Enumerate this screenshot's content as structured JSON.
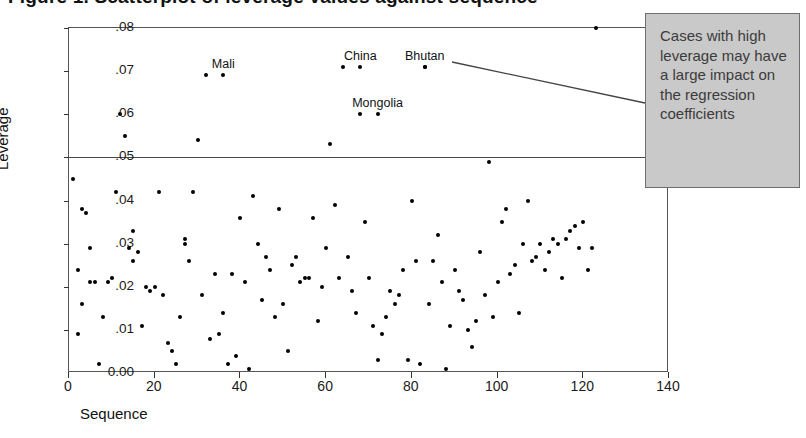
{
  "title": "Figure 1. Scatterplot of leverage values against sequence",
  "annotation": {
    "text": "Cases with high leverage may have a large impact on the regression coefficients",
    "box_color": "#c9c9c9",
    "border_color": "#6e6e6e"
  },
  "axes": {
    "ylabel": "Leverage",
    "xlabel": "Sequence",
    "yticks": [
      "0.00",
      ".01",
      ".02",
      ".03",
      ".04",
      ".05",
      ".06",
      ".07",
      ".08"
    ],
    "ytick_values": [
      0,
      0.01,
      0.02,
      0.03,
      0.04,
      0.05,
      0.06,
      0.07,
      0.08
    ],
    "xticks": [
      "0",
      "20",
      "40",
      "60",
      "80",
      "100",
      "120",
      "140"
    ],
    "xtick_values": [
      0,
      20,
      40,
      60,
      80,
      100,
      120,
      140
    ]
  },
  "chart_data": {
    "type": "scatter",
    "title": "Figure 1. Scatterplot of leverage values against sequence",
    "xlabel": "Sequence",
    "ylabel": "Leverage",
    "xlim": [
      0,
      140
    ],
    "ylim": [
      0,
      0.08
    ],
    "grid": false,
    "legend": "none",
    "reference_lines": [
      {
        "axis": "y",
        "value": 0.05,
        "label": "leverage cutoff"
      }
    ],
    "annotations": [
      {
        "text": "Mali",
        "x": 36,
        "y": 0.069
      },
      {
        "text": "China",
        "x": 68,
        "y": 0.071
      },
      {
        "text": "Bhutan",
        "x": 83,
        "y": 0.071
      },
      {
        "text": "Mongolia",
        "x": 72,
        "y": 0.06
      }
    ],
    "labeled_points": [
      {
        "name": "Mali",
        "x": 36,
        "y": 0.069
      },
      {
        "name": "China",
        "x": 68,
        "y": 0.071
      },
      {
        "name": "Bhutan",
        "x": 83,
        "y": 0.071
      },
      {
        "name": "Mongolia",
        "x": 72,
        "y": 0.06
      }
    ],
    "x": [
      1,
      2,
      2,
      3,
      3,
      4,
      5,
      5,
      6,
      7,
      8,
      9,
      10,
      11,
      12,
      13,
      14,
      15,
      15,
      16,
      17,
      18,
      19,
      20,
      21,
      22,
      23,
      24,
      25,
      26,
      27,
      27,
      28,
      29,
      30,
      31,
      32,
      33,
      34,
      35,
      36,
      37,
      38,
      39,
      40,
      41,
      42,
      43,
      44,
      45,
      46,
      47,
      48,
      49,
      50,
      51,
      52,
      53,
      54,
      55,
      56,
      57,
      58,
      59,
      60,
      61,
      62,
      63,
      64,
      65,
      66,
      67,
      68,
      69,
      70,
      71,
      72,
      73,
      74,
      75,
      76,
      77,
      78,
      79,
      80,
      81,
      82,
      83,
      84,
      85,
      86,
      87,
      88,
      89,
      90,
      91,
      92,
      93,
      94,
      95,
      96,
      97,
      98,
      99,
      100,
      101,
      102,
      103,
      104,
      105,
      106,
      107,
      108,
      109,
      110,
      111,
      112,
      113,
      114,
      115,
      116,
      117,
      118,
      119,
      120,
      121,
      122,
      123
    ],
    "y": [
      0.045,
      0.024,
      0.009,
      0.016,
      0.038,
      0.037,
      0.029,
      0.021,
      0.021,
      0.002,
      0.013,
      0.021,
      0.022,
      0.042,
      0.06,
      0.055,
      0.029,
      0.026,
      0.033,
      0.028,
      0.011,
      0.02,
      0.019,
      0.02,
      0.042,
      0.018,
      0.007,
      0.005,
      0.002,
      0.013,
      0.03,
      0.031,
      0.026,
      0.042,
      0.054,
      0.018,
      0.069,
      0.008,
      0.023,
      0.009,
      0.014,
      0.002,
      0.023,
      0.004,
      0.036,
      0.021,
      0.001,
      0.041,
      0.03,
      0.017,
      0.027,
      0.024,
      0.013,
      0.038,
      0.016,
      0.005,
      0.025,
      0.027,
      0.021,
      0.022,
      0.022,
      0.036,
      0.012,
      0.02,
      0.029,
      0.053,
      0.039,
      0.022,
      0.071,
      0.027,
      0.019,
      0.014,
      0.06,
      0.035,
      0.022,
      0.011,
      0.003,
      0.009,
      0.013,
      0.019,
      0.016,
      0.018,
      0.024,
      0.003,
      0.04,
      0.026,
      0.002,
      0.071,
      0.016,
      0.026,
      0.032,
      0.021,
      0.001,
      0.011,
      0.024,
      0.019,
      0.017,
      0.01,
      0.006,
      0.012,
      0.028,
      0.018,
      0.049,
      0.013,
      0.021,
      0.035,
      0.038,
      0.023,
      0.025,
      0.014,
      0.03,
      0.04,
      0.026,
      0.027,
      0.03,
      0.024,
      0.028,
      0.031,
      0.03,
      0.022,
      0.031,
      0.033,
      0.034,
      0.029,
      0.035,
      0.024,
      0.029
    ]
  }
}
